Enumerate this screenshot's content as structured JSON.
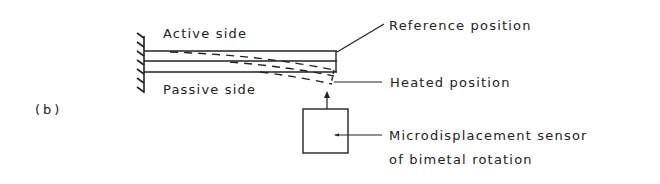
{
  "figure": {
    "panel_label": "(b)",
    "colors": {
      "ink": "#222222",
      "background": "#ffffff"
    },
    "labels": {
      "active_side": "Active side",
      "passive_side": "Passive side",
      "reference_position": "Reference position",
      "heated_position": "Heated position",
      "sensor_line1": "Microdisplacement sensor",
      "sensor_line2": "of bimetal rotation"
    },
    "components": [
      {
        "id": "fixed-wall",
        "description": "hatched clamped support"
      },
      {
        "id": "bimetal-strip-reference",
        "style": "solid",
        "layers": 2
      },
      {
        "id": "bimetal-strip-heated",
        "style": "dashed",
        "layers": 2
      },
      {
        "id": "sensor-box",
        "description": "microdisplacement sensor"
      }
    ]
  }
}
